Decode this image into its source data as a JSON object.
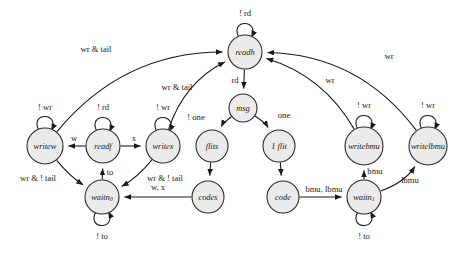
{
  "diagram": {
    "background": "#ffffff",
    "node_fill": "#ebebeb",
    "node_stroke": "#2b2b2b",
    "edge_stroke": "#1a1a1a"
  },
  "nodes": [
    {
      "id": "readh",
      "label": "readh",
      "sub": "",
      "cx": 245,
      "cy": 52,
      "r": 17
    },
    {
      "id": "msg",
      "label": "msg",
      "sub": "",
      "cx": 243,
      "cy": 108,
      "r": 14
    },
    {
      "id": "flits",
      "label": "flits",
      "sub": "",
      "cx": 212,
      "cy": 146,
      "r": 16
    },
    {
      "id": "oneflit",
      "label": "1 flit",
      "sub": "",
      "cx": 279,
      "cy": 146,
      "r": 16
    },
    {
      "id": "writew",
      "label": "writew",
      "sub": "",
      "cx": 45,
      "cy": 146,
      "r": 18
    },
    {
      "id": "readf",
      "label": "readf",
      "sub": "",
      "cx": 103,
      "cy": 146,
      "r": 17
    },
    {
      "id": "writex",
      "label": "writex",
      "sub": "",
      "cx": 163,
      "cy": 146,
      "r": 17
    },
    {
      "id": "writebmu",
      "label": "writebmu",
      "sub": "",
      "cx": 364,
      "cy": 146,
      "r": 19
    },
    {
      "id": "writelbmu",
      "label": "writelbmu",
      "sub": "",
      "cx": 428,
      "cy": 146,
      "r": 19
    },
    {
      "id": "waitn0",
      "label": "waitn",
      "sub": "0",
      "cx": 102,
      "cy": 197,
      "r": 17
    },
    {
      "id": "codes",
      "label": "codes",
      "sub": "",
      "cx": 208,
      "cy": 197,
      "r": 16
    },
    {
      "id": "code",
      "label": "code",
      "sub": "",
      "cx": 283,
      "cy": 197,
      "r": 16
    },
    {
      "id": "waitn1",
      "label": "waitn",
      "sub": "1",
      "cx": 364,
      "cy": 197,
      "r": 17
    }
  ],
  "self_loops": [
    {
      "id": "loop-readh",
      "node": "readh",
      "label": "! rd",
      "lx": 245,
      "ly": 14
    },
    {
      "id": "loop-writew",
      "node": "writew",
      "label": "! wr",
      "lx": 45,
      "ly": 108
    },
    {
      "id": "loop-readf",
      "node": "readf",
      "label": "! rd",
      "lx": 103,
      "ly": 108
    },
    {
      "id": "loop-writex",
      "node": "writex",
      "label": "! wr",
      "lx": 163,
      "ly": 108
    },
    {
      "id": "loop-writebmu",
      "node": "writebmu",
      "label": "! wr",
      "lx": 364,
      "ly": 106
    },
    {
      "id": "loop-writelbmu",
      "node": "writelbmu",
      "label": "! wr",
      "lx": 428,
      "ly": 106
    },
    {
      "id": "loop-waitn0",
      "node": "waitn0",
      "label": "! to",
      "lx": 102,
      "ly": 237
    },
    {
      "id": "loop-waitn1",
      "node": "waitn1",
      "label": "! to",
      "lx": 364,
      "ly": 237
    }
  ],
  "edges": [
    {
      "id": "readf-writew",
      "from": "readf",
      "to": "writew",
      "label": "w",
      "lx": 74,
      "ly": 139
    },
    {
      "id": "readf-writex",
      "from": "readf",
      "to": "writex",
      "label": "x",
      "lx": 134,
      "ly": 139
    },
    {
      "id": "readh-msg",
      "from": "readh",
      "to": "msg",
      "label": "rd",
      "lx": 235,
      "ly": 81
    },
    {
      "id": "msg-flits",
      "from": "msg",
      "to": "flits",
      "label": "! one",
      "lx": 196,
      "ly": 118
    },
    {
      "id": "msg-oneflit",
      "from": "msg",
      "to": "oneflit",
      "label": "one",
      "lx": 284,
      "ly": 116
    },
    {
      "id": "flits-codes",
      "from": "flits",
      "to": "codes",
      "label": "",
      "lx": 0,
      "ly": 0
    },
    {
      "id": "oneflit-code",
      "from": "oneflit",
      "to": "code",
      "label": "",
      "lx": 0,
      "ly": 0
    },
    {
      "id": "codes-waitn0",
      "from": "codes",
      "to": "waitn0",
      "label": "w, x",
      "lx": 158,
      "ly": 188
    },
    {
      "id": "code-waitn1",
      "from": "code",
      "to": "waitn1",
      "label": "bmu, lbmu",
      "lx": 324,
      "ly": 190
    },
    {
      "id": "waitn0-readf",
      "from": "waitn0",
      "to": "readf",
      "label": "to",
      "lx": 110,
      "ly": 173
    },
    {
      "id": "writew-waitn0",
      "from": "writew",
      "to": "waitn0",
      "label": "wr & ! tail",
      "lx": 38,
      "ly": 179
    },
    {
      "id": "writex-waitn0",
      "from": "writex",
      "to": "waitn0",
      "label": "wr & ! tail",
      "lx": 165,
      "ly": 179
    },
    {
      "id": "waitn1-writebmu",
      "from": "waitn1",
      "to": "writebmu",
      "label": "bmu",
      "lx": 375,
      "ly": 172
    },
    {
      "id": "waitn1-writelbmu",
      "from": "waitn1",
      "to": "writelbmu",
      "label": "lbmu",
      "lx": 410,
      "ly": 181
    },
    {
      "id": "writew-readh",
      "from": "writew",
      "to": "readh",
      "label": "wr & tail",
      "lx": 96,
      "ly": 50
    },
    {
      "id": "writex-readh",
      "from": "writex",
      "to": "readh",
      "label": "wr & tail",
      "lx": 177,
      "ly": 88
    },
    {
      "id": "writebmu-readh",
      "from": "writebmu",
      "to": "readh",
      "label": "wr",
      "lx": 330,
      "ly": 81
    },
    {
      "id": "writelbmu-readh",
      "from": "writelbmu",
      "to": "readh",
      "label": "wr",
      "lx": 389,
      "ly": 57
    }
  ]
}
